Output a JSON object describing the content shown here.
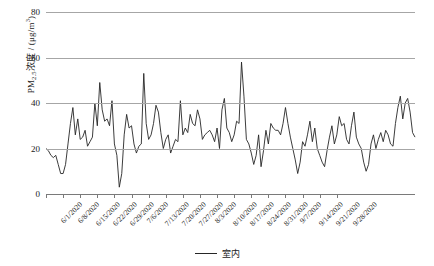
{
  "chart_data": {
    "type": "line",
    "title": "",
    "xlabel": "",
    "ylabel": "PM2.5浓度 /(μg/m³)",
    "ylabel_parts": {
      "prefix": "PM",
      "sub": "2.5",
      "mid": "浓度 / (μg/m",
      "sup": "3",
      "suffix": ")"
    },
    "ylim": [
      0,
      80
    ],
    "yticks": [
      0,
      20,
      40,
      60,
      80
    ],
    "ytick_labels": [
      "0",
      "20",
      "40",
      "60",
      "80"
    ],
    "grid": true,
    "grid_axis": "y",
    "legend_position": "bottom-center",
    "series": [
      {
        "name": "室内",
        "color": "#262626",
        "x_start": "6/1/2020",
        "x_end": "9/30/2020",
        "values": [
          20,
          19,
          17,
          16,
          17,
          13,
          9,
          9,
          13,
          22,
          31,
          38,
          26,
          33,
          24,
          25,
          28,
          21,
          23,
          25,
          40,
          30,
          49,
          37,
          32,
          33,
          30,
          41,
          22,
          17,
          3,
          9,
          26,
          35,
          29,
          30,
          22,
          18,
          21,
          22,
          53,
          31,
          24,
          26,
          31,
          39,
          36,
          27,
          20,
          24,
          26,
          18,
          21,
          24,
          23,
          41,
          26,
          29,
          27,
          35,
          31,
          30,
          37,
          33,
          24,
          26,
          27,
          28,
          26,
          23,
          29,
          20,
          37,
          42,
          29,
          27,
          23,
          26,
          32,
          31,
          58,
          43,
          24,
          22,
          18,
          13,
          17,
          26,
          12,
          19,
          28,
          22,
          31,
          29,
          28,
          28,
          26,
          31,
          38,
          31,
          25,
          20,
          15,
          9,
          14,
          23,
          21,
          26,
          32,
          23,
          29,
          20,
          17,
          14,
          12,
          19,
          25,
          30,
          22,
          26,
          34,
          30,
          31,
          24,
          22,
          30,
          36,
          25,
          22,
          20,
          14,
          10,
          13,
          22,
          26,
          20,
          24,
          27,
          23,
          28,
          26,
          22,
          21,
          31,
          38,
          43,
          33,
          40,
          42,
          36,
          27,
          25
        ]
      }
    ],
    "xtick_labels": [
      "6/1/2020",
      "6/8/2020",
      "6/15/2020",
      "6/22/2020",
      "6/29/2020",
      "7/6/2020",
      "7/13/2020",
      "7/20/2020",
      "7/27/2020",
      "8/3/2020",
      "8/10/2020",
      "8/17/2020",
      "8/24/2020",
      "8/31/2020",
      "9/7/2020",
      "9/14/2020",
      "9/21/2020",
      "9/28/2020"
    ]
  },
  "legend": {
    "entries": [
      {
        "label": "室内",
        "color": "#262626"
      }
    ]
  }
}
